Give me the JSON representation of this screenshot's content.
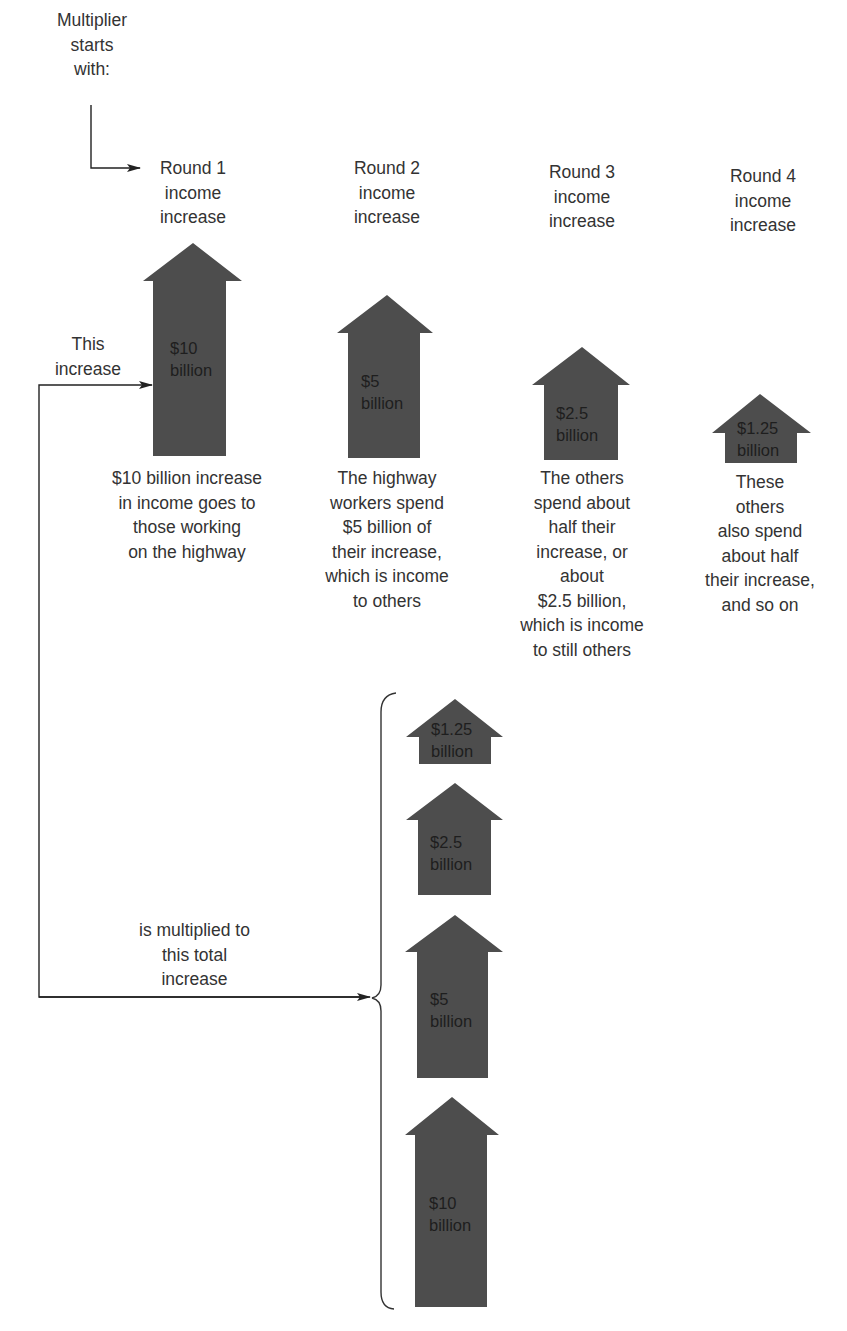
{
  "start_label": "Multiplier\nstarts\nwith:",
  "this_increase_label": "This\nincrease",
  "multiplied_label": "is multiplied to\nthis total\nincrease",
  "colors": {
    "arrow_fill": "#4d4d4d",
    "line": "#222222",
    "text": "#333333"
  },
  "rounds": [
    {
      "header": "Round 1\nincome\nincrease",
      "amount": "$10\nbillion",
      "description": "$10 billion increase\nin income goes to\nthose working\non the highway"
    },
    {
      "header": "Round 2\nincome\nincrease",
      "amount": "$5\nbillion",
      "description": "The highway\nworkers spend\n$5 billion of\ntheir increase,\nwhich is income\nto others"
    },
    {
      "header": "Round 3\nincome\nincrease",
      "amount": "$2.5\nbillion",
      "description": "The others\nspend about\nhalf their\nincrease, or\nabout\n$2.5 billion,\nwhich is income\nto still others"
    },
    {
      "header": "Round 4\nincome\nincrease",
      "amount": "$1.25\nbillion",
      "description": "These\nothers\nalso spend\nabout half\ntheir increase,\nand so on"
    }
  ],
  "total_stack": [
    {
      "amount": "$1.25\nbillion"
    },
    {
      "amount": "$2.5\nbillion"
    },
    {
      "amount": "$5\nbillion"
    },
    {
      "amount": "$10\nbillion"
    }
  ]
}
